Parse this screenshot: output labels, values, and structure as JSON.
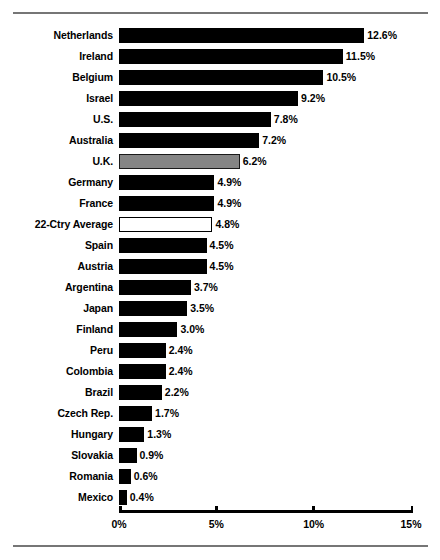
{
  "figure": {
    "top_rule": "horizontal-rule",
    "bottom_rule": "horizontal-rule",
    "caption": ""
  },
  "chart_data": {
    "type": "bar",
    "orientation": "horizontal",
    "title": "",
    "subtitle": "",
    "xlabel": "",
    "ylabel": "",
    "xlim": [
      0,
      15
    ],
    "grid": false,
    "legend": null,
    "value_suffix": "%",
    "tick_labels": [
      "0%",
      "5%",
      "10%",
      "15%"
    ],
    "ticks": [
      0,
      5,
      10,
      15
    ],
    "categories": [
      "Netherlands",
      "Ireland",
      "Belgium",
      "Israel",
      "U.S.",
      "Australia",
      "U.K.",
      "Germany",
      "France",
      "22-Ctry Average",
      "Spain",
      "Austria",
      "Argentina",
      "Japan",
      "Finland",
      "Peru",
      "Colombia",
      "Brazil",
      "Czech Rep.",
      "Hungary",
      "Slovakia",
      "Romania",
      "Mexico"
    ],
    "values": [
      12.6,
      11.5,
      10.5,
      9.2,
      7.8,
      7.2,
      6.2,
      4.9,
      4.9,
      4.8,
      4.5,
      4.5,
      3.7,
      3.5,
      3.0,
      2.4,
      2.4,
      2.2,
      1.7,
      1.3,
      0.9,
      0.6,
      0.4
    ],
    "value_labels": [
      "12.6%",
      "11.5%",
      "10.5%",
      "9.2%",
      "7.8%",
      "7.2%",
      "6.2%",
      "4.9%",
      "4.9%",
      "4.8%",
      "4.5%",
      "4.5%",
      "3.7%",
      "3.5%",
      "3.0%",
      "2.4%",
      "2.4%",
      "2.2%",
      "1.7%",
      "1.3%",
      "0.9%",
      "0.6%",
      "0.4%"
    ],
    "bar_styles": [
      "solid",
      "solid",
      "solid",
      "solid",
      "solid",
      "solid",
      "highlight-gray",
      "solid",
      "solid",
      "hollow",
      "solid",
      "solid",
      "solid",
      "solid",
      "solid",
      "solid",
      "solid",
      "solid",
      "solid",
      "solid",
      "solid",
      "solid",
      "solid"
    ],
    "colors": {
      "bar_solid": "#000000",
      "bar_highlight": "#858585",
      "bar_hollow": "#ffffff",
      "bar_outline": "#000000",
      "axis": "#000000",
      "rule": "#767676",
      "text": "#000000"
    }
  }
}
